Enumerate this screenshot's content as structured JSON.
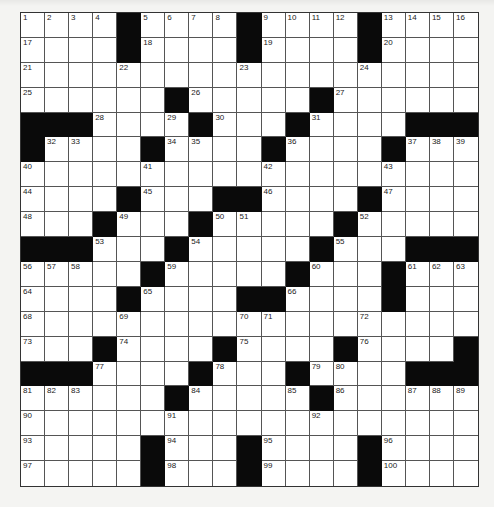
{
  "puzzle": {
    "rows": 19,
    "cols": 19,
    "layout": [
      "....#....#....#....",
      "....#....#....#....",
      "...................",
      "......#.....#......",
      "###....#...#....###",
      "#....#....#....#...",
      "...................",
      "....#...##....#....",
      "...#...#.....#.....",
      "###...#.....#...###",
      ".....#.....#...#...",
      "....#....##....#...",
      "...................",
      "...#....#....#....#",
      "###....#...#....###",
      "......#.....#......",
      "...................",
      ".....#...#....#....",
      ".....#...#....#...."
    ],
    "numbers": [
      [
        0,
        0,
        1
      ],
      [
        0,
        1,
        2
      ],
      [
        0,
        2,
        3
      ],
      [
        0,
        3,
        4
      ],
      [
        0,
        5,
        5
      ],
      [
        0,
        6,
        6
      ],
      [
        0,
        7,
        7
      ],
      [
        0,
        8,
        8
      ],
      [
        0,
        10,
        9
      ],
      [
        0,
        11,
        10
      ],
      [
        0,
        12,
        11
      ],
      [
        0,
        13,
        12
      ],
      [
        0,
        15,
        13
      ],
      [
        0,
        16,
        14
      ],
      [
        0,
        17,
        15
      ],
      [
        0,
        18,
        16
      ],
      [
        1,
        0,
        17
      ],
      [
        1,
        5,
        18
      ],
      [
        1,
        10,
        19
      ],
      [
        1,
        15,
        20
      ],
      [
        2,
        0,
        21
      ],
      [
        2,
        4,
        22
      ],
      [
        2,
        9,
        23
      ],
      [
        2,
        14,
        24
      ],
      [
        3,
        0,
        25
      ],
      [
        3,
        7,
        26
      ],
      [
        3,
        13,
        27
      ],
      [
        4,
        3,
        28
      ],
      [
        4,
        6,
        29
      ],
      [
        4,
        8,
        30
      ],
      [
        4,
        12,
        31
      ],
      [
        5,
        1,
        32
      ],
      [
        5,
        2,
        33
      ],
      [
        5,
        6,
        34
      ],
      [
        5,
        7,
        35
      ],
      [
        5,
        11,
        36
      ],
      [
        5,
        16,
        37
      ],
      [
        5,
        17,
        38
      ],
      [
        5,
        18,
        39
      ],
      [
        6,
        0,
        40
      ],
      [
        6,
        5,
        41
      ],
      [
        6,
        10,
        42
      ],
      [
        6,
        15,
        43
      ],
      [
        7,
        0,
        44
      ],
      [
        7,
        5,
        45
      ],
      [
        7,
        10,
        46
      ],
      [
        7,
        15,
        47
      ],
      [
        8,
        0,
        48
      ],
      [
        8,
        4,
        49
      ],
      [
        8,
        8,
        50
      ],
      [
        8,
        9,
        51
      ],
      [
        8,
        14,
        52
      ],
      [
        9,
        3,
        53
      ],
      [
        9,
        7,
        54
      ],
      [
        9,
        13,
        55
      ],
      [
        10,
        0,
        56
      ],
      [
        10,
        1,
        57
      ],
      [
        10,
        2,
        58
      ],
      [
        10,
        6,
        59
      ],
      [
        10,
        12,
        60
      ],
      [
        10,
        16,
        61
      ],
      [
        10,
        17,
        62
      ],
      [
        10,
        18,
        63
      ],
      [
        11,
        0,
        64
      ],
      [
        11,
        5,
        65
      ],
      [
        11,
        11,
        66
      ],
      [
        11,
        15,
        67
      ],
      [
        12,
        0,
        68
      ],
      [
        12,
        4,
        69
      ],
      [
        12,
        9,
        70
      ],
      [
        12,
        10,
        71
      ],
      [
        12,
        14,
        72
      ],
      [
        13,
        0,
        73
      ],
      [
        13,
        4,
        74
      ],
      [
        13,
        9,
        75
      ],
      [
        13,
        14,
        76
      ],
      [
        14,
        3,
        77
      ],
      [
        14,
        8,
        78
      ],
      [
        14,
        12,
        79
      ],
      [
        14,
        13,
        80
      ],
      [
        15,
        0,
        81
      ],
      [
        15,
        1,
        82
      ],
      [
        15,
        2,
        83
      ],
      [
        15,
        7,
        84
      ],
      [
        15,
        11,
        85
      ],
      [
        15,
        13,
        86
      ],
      [
        15,
        16,
        87
      ],
      [
        15,
        17,
        88
      ],
      [
        15,
        18,
        89
      ],
      [
        16,
        0,
        90
      ],
      [
        16,
        6,
        91
      ],
      [
        16,
        12,
        92
      ],
      [
        17,
        0,
        93
      ],
      [
        17,
        6,
        94
      ],
      [
        17,
        10,
        95
      ],
      [
        17,
        15,
        96
      ],
      [
        18,
        0,
        97
      ],
      [
        18,
        6,
        98
      ],
      [
        18,
        10,
        99
      ],
      [
        18,
        15,
        100
      ]
    ],
    "colors": {
      "black_square": "#0a0a0a",
      "white_square": "#ffffff",
      "grid_line": "#555555",
      "page_bg": "#f4f4f2"
    }
  }
}
